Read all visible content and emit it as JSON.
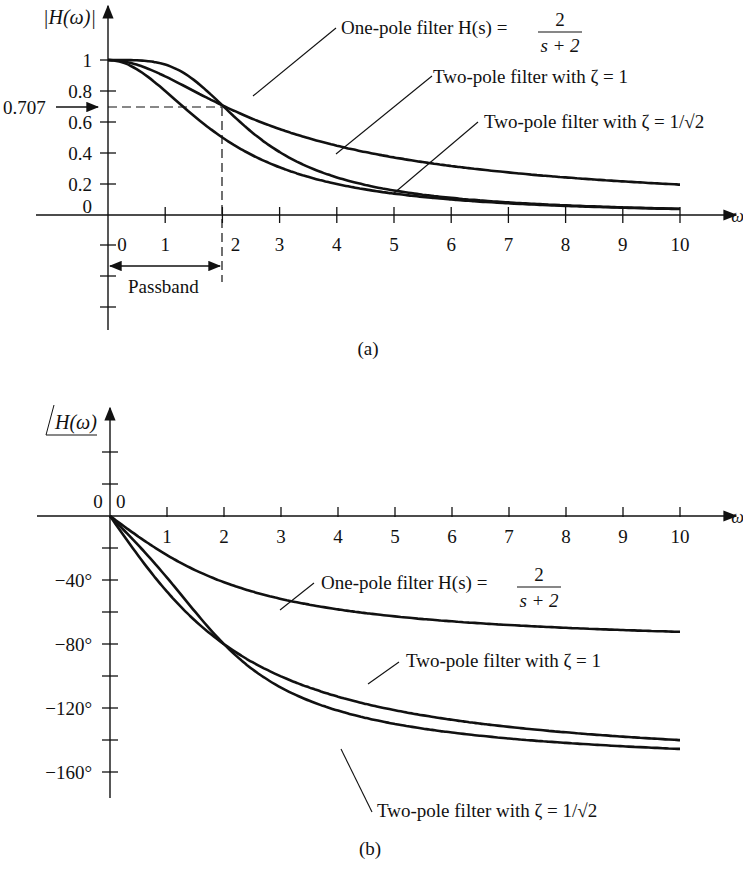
{
  "chart_data": [
    {
      "id": "a",
      "type": "line",
      "caption": "(a)",
      "ylabel": "|H(ω)|",
      "xlabel": "ω",
      "xlim": [
        0,
        10
      ],
      "ylim": [
        0,
        1
      ],
      "x_ticks": [
        "0",
        "1",
        "2",
        "3",
        "4",
        "5",
        "6",
        "7",
        "8",
        "9",
        "10"
      ],
      "y_ticks": [
        "0",
        "0.2",
        "0.4",
        "0.6",
        "0.8",
        "1"
      ],
      "annotations": {
        "cutoff_value": "0.707",
        "passband_label": "Passband",
        "cutoff_omega": 2
      },
      "series": [
        {
          "name": "One-pole filter H(s) = 2/(s + 2)",
          "label_text": "One-pole filter H(s) =",
          "frac_num": "2",
          "frac_den": "s + 2",
          "x": [
            0,
            1,
            2,
            3,
            4,
            5,
            6,
            7,
            8,
            9,
            10
          ],
          "values": [
            1,
            0.894,
            0.707,
            0.555,
            0.447,
            0.371,
            0.316,
            0.275,
            0.243,
            0.217,
            0.196
          ]
        },
        {
          "name": "Two-pole filter with ζ = 1",
          "label_text": "Two-pole filter with ζ = 1",
          "x": [
            0,
            1,
            2,
            3,
            4,
            5,
            6,
            7,
            8,
            9,
            10
          ],
          "values": [
            1,
            0.8,
            0.5,
            0.308,
            0.2,
            0.138,
            0.1,
            0.075,
            0.059,
            0.047,
            0.038
          ]
        },
        {
          "name": "Two-pole filter with ζ = 1/√2",
          "label_text": "Two-pole filter with ζ = 1/√2",
          "x": [
            0,
            1,
            2,
            3,
            4,
            5,
            6,
            7,
            8,
            9,
            10
          ],
          "values": [
            1,
            0.97,
            0.707,
            0.406,
            0.243,
            0.158,
            0.11,
            0.081,
            0.062,
            0.049,
            0.04
          ]
        }
      ]
    },
    {
      "id": "b",
      "type": "line",
      "caption": "(b)",
      "ylabel": "∠H(ω)",
      "xlabel": "ω",
      "xlim": [
        0,
        10
      ],
      "ylim": [
        -180,
        20
      ],
      "x_ticks": [
        "0",
        "1",
        "2",
        "3",
        "4",
        "5",
        "6",
        "7",
        "8",
        "9",
        "10"
      ],
      "y_ticks": [
        "0",
        "−40°",
        "−80°",
        "−120°",
        "−160°"
      ],
      "series": [
        {
          "name": "One-pole filter H(s) = 2/(s + 2)",
          "label_text": "One-pole filter H(s) =",
          "frac_num": "2",
          "frac_den": "s + 2",
          "x": [
            0,
            1,
            2,
            3,
            4,
            5,
            6,
            7,
            8,
            9,
            10
          ],
          "values": [
            0,
            -26.6,
            -45,
            -56.3,
            -63.4,
            -68.2,
            -71.6,
            -74,
            -76,
            -77.5,
            -78.7
          ]
        },
        {
          "name": "Two-pole filter with ζ = 1",
          "label_text": "Two-pole filter with ζ = 1",
          "x": [
            0,
            1,
            2,
            3,
            4,
            5,
            6,
            7,
            8,
            9,
            10
          ],
          "values": [
            0,
            -53.1,
            -90,
            -112.6,
            -126.9,
            -136.4,
            -143.1,
            -148,
            -151.9,
            -155,
            -157.4
          ]
        },
        {
          "name": "Two-pole filter with ζ = 1/√2",
          "label_text": "Two-pole filter with ζ = 1/√2",
          "x": [
            0,
            1,
            2,
            3,
            4,
            5,
            6,
            7,
            8,
            9,
            10
          ],
          "values": [
            0,
            -43.3,
            -90,
            -118.4,
            -135,
            -144.3,
            -150.7,
            -155.2,
            -158.4,
            -160.8,
            -162.6
          ]
        }
      ]
    }
  ]
}
